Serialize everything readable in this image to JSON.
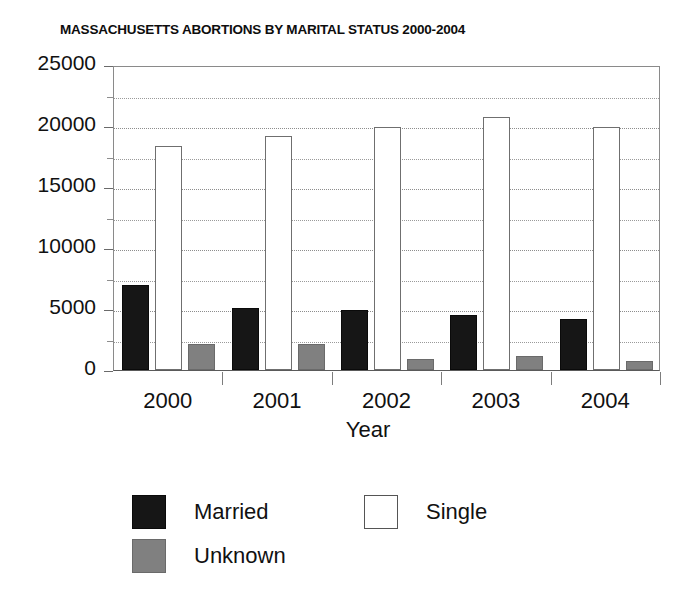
{
  "chart_data": {
    "type": "bar",
    "title": "MASSACHUSETTS ABORTIONS BY MARITAL STATUS 2000-2004",
    "xlabel": "Year",
    "ylabel": "",
    "categories": [
      "2000",
      "2001",
      "2002",
      "2003",
      "2004"
    ],
    "series": [
      {
        "name": "Married",
        "color": "#161616",
        "values": [
          6970,
          5080,
          4920,
          4500,
          4180
        ]
      },
      {
        "name": "Single",
        "color": "#ffffff",
        "values": [
          18350,
          19150,
          19900,
          20700,
          19950
        ]
      },
      {
        "name": "Unknown",
        "color": "#808080",
        "values": [
          2130,
          2130,
          900,
          1150,
          750
        ]
      }
    ],
    "ylim": [
      0,
      25000
    ],
    "y_major_ticks": [
      0,
      5000,
      10000,
      15000,
      20000,
      25000
    ],
    "y_tick_labels": [
      "0",
      "5000",
      "10000",
      "15000",
      "20000",
      "25000"
    ],
    "y_minor_tick_interval": 2500,
    "grid": true,
    "grid_style": "dotted",
    "legend_position": "bottom-left",
    "legend_entries": [
      "Married",
      "Single",
      "Unknown"
    ]
  },
  "axes": {
    "x_title": "Year"
  }
}
